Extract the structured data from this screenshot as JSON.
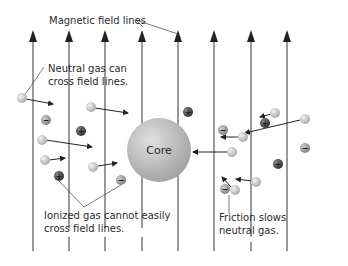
{
  "labels": {
    "field_lines": "Magnetic field lines",
    "neutral_line1": "Neutral gas can",
    "neutral_line2": "cross field lines.",
    "ionized_line1": "Ionized gas cannot easily",
    "ionized_line2": "cross field lines.",
    "friction_line1": "Friction slows",
    "friction_line2": "neutral gas.",
    "core": "Core"
  },
  "colors": {
    "background": "#ffffff",
    "field_line": "#555555",
    "arrow": "#222222",
    "core": "#b8b8b8",
    "neutral": "#c8c8c8",
    "negative_ion": "#9a9a9a",
    "positive_ion": "#4a4a4a",
    "text": "#2a2a2a"
  },
  "field_lines_x": [
    33,
    69,
    105,
    142,
    178,
    214,
    251,
    287
  ],
  "ion_signs": {
    "positive": "+",
    "negative": "−"
  }
}
